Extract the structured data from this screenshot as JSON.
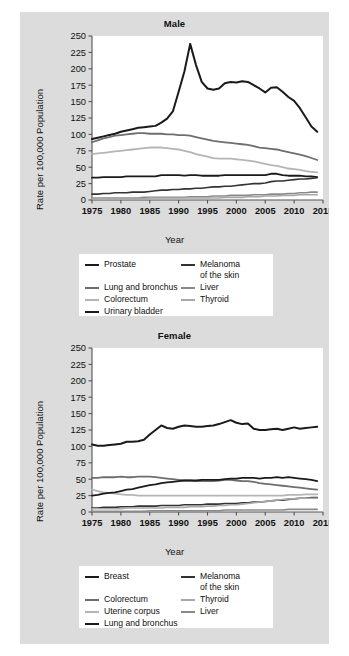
{
  "figure": {
    "background": "#dcdcdc",
    "panel_background": "#ffffff"
  },
  "chart_data": [
    {
      "type": "line",
      "title": "Male",
      "xlabel": "Year",
      "ylabel": "Rate per 100,000 Population",
      "xlim": [
        1975,
        2015
      ],
      "ylim": [
        0,
        250
      ],
      "xticks": [
        1975,
        1980,
        1985,
        1990,
        1995,
        2000,
        2005,
        2010,
        2015
      ],
      "yticks": [
        0,
        25,
        50,
        75,
        100,
        125,
        150,
        175,
        200,
        225,
        250
      ],
      "grid": false,
      "legend_position": "below",
      "x": [
        1975,
        1976,
        1977,
        1978,
        1979,
        1980,
        1981,
        1982,
        1983,
        1984,
        1985,
        1986,
        1987,
        1988,
        1989,
        1990,
        1991,
        1992,
        1993,
        1994,
        1995,
        1996,
        1997,
        1998,
        1999,
        2000,
        2001,
        2002,
        2003,
        2004,
        2005,
        2006,
        2007,
        2008,
        2009,
        2010,
        2011,
        2012,
        2013,
        2014
      ],
      "series": [
        {
          "name": "Prostate",
          "color": "#1a1a1a",
          "width": 2.0,
          "values": [
            93,
            95,
            97,
            99,
            101,
            104,
            106,
            108,
            110,
            111,
            112,
            113,
            118,
            124,
            135,
            165,
            196,
            238,
            206,
            180,
            170,
            168,
            170,
            178,
            180,
            179,
            181,
            180,
            175,
            170,
            164,
            171,
            172,
            165,
            157,
            151,
            140,
            126,
            112,
            104
          ]
        },
        {
          "name": "Lung and bronchus",
          "color": "#6e6e6e",
          "width": 1.8,
          "values": [
            88,
            91,
            94,
            96,
            98,
            99,
            100,
            101,
            102,
            102,
            101,
            101,
            101,
            100,
            100,
            99,
            99,
            98,
            96,
            94,
            92,
            90,
            89,
            88,
            87,
            86,
            85,
            84,
            82,
            80,
            79,
            78,
            77,
            75,
            73,
            71,
            69,
            67,
            64,
            61
          ]
        },
        {
          "name": "Colorectum",
          "color": "#b5b5b5",
          "width": 1.8,
          "values": [
            70,
            71,
            72,
            73,
            74,
            75,
            76,
            77,
            78,
            79,
            80,
            80,
            80,
            79,
            78,
            77,
            75,
            73,
            70,
            68,
            66,
            64,
            63,
            63,
            63,
            62,
            61,
            60,
            59,
            57,
            55,
            53,
            52,
            50,
            48,
            47,
            46,
            44,
            43,
            42
          ]
        },
        {
          "name": "Urinary bladder",
          "color": "#1a1a1a",
          "width": 1.8,
          "values": [
            34,
            34,
            35,
            35,
            35,
            35,
            36,
            36,
            36,
            36,
            36,
            36,
            38,
            38,
            38,
            38,
            37,
            38,
            38,
            37,
            37,
            37,
            37,
            38,
            38,
            38,
            38,
            38,
            38,
            38,
            38,
            40,
            40,
            38,
            37,
            37,
            37,
            36,
            36,
            35
          ]
        },
        {
          "name": "Melanoma of the skin",
          "color": "#333333",
          "width": 1.6,
          "values": [
            9,
            9,
            10,
            10,
            11,
            11,
            11,
            12,
            12,
            12,
            13,
            14,
            15,
            15,
            16,
            16,
            17,
            17,
            18,
            18,
            19,
            20,
            20,
            21,
            21,
            22,
            23,
            24,
            25,
            25,
            26,
            28,
            29,
            29,
            30,
            31,
            32,
            32,
            33,
            34
          ]
        },
        {
          "name": "Liver",
          "color": "#8a8a8a",
          "width": 1.6,
          "values": [
            3,
            3,
            3,
            3,
            3,
            3,
            3,
            3,
            3,
            4,
            4,
            4,
            4,
            4,
            4,
            4,
            4,
            5,
            5,
            5,
            5,
            6,
            6,
            6,
            7,
            7,
            7,
            7,
            8,
            8,
            8,
            9,
            9,
            9,
            10,
            10,
            11,
            11,
            12,
            12
          ]
        },
        {
          "name": "Thyroid",
          "color": "#a8a8a8",
          "width": 1.6,
          "values": [
            2,
            2,
            2,
            2,
            2,
            2,
            2,
            2,
            2,
            2,
            3,
            3,
            3,
            3,
            3,
            3,
            3,
            3,
            3,
            3,
            3,
            3,
            3,
            4,
            4,
            4,
            4,
            5,
            5,
            5,
            6,
            6,
            6,
            7,
            7,
            7,
            8,
            8,
            8,
            8
          ]
        }
      ],
      "legend": [
        {
          "label": "Prostate",
          "color": "#1a1a1a"
        },
        {
          "label": "Melanoma",
          "label2": "of the skin",
          "color": "#333333"
        },
        {
          "label": "Lung and bronchus",
          "color": "#6e6e6e"
        },
        {
          "label": "Colorectum",
          "color": "#b5b5b5"
        },
        {
          "label": "Liver",
          "color": "#8a8a8a"
        },
        {
          "label": "Urinary bladder",
          "color": "#1a1a1a"
        },
        {
          "label": "Thyroid",
          "color": "#a8a8a8"
        }
      ]
    },
    {
      "type": "line",
      "title": "Female",
      "xlabel": "Year",
      "ylabel": "Rate per 100,000 Population",
      "xlim": [
        1975,
        2015
      ],
      "ylim": [
        0,
        250
      ],
      "xticks": [
        1975,
        1980,
        1985,
        1990,
        1995,
        2000,
        2005,
        2010,
        2015
      ],
      "yticks": [
        0,
        25,
        50,
        75,
        100,
        125,
        150,
        175,
        200,
        225,
        250
      ],
      "grid": false,
      "legend_position": "below",
      "x": [
        1975,
        1976,
        1977,
        1978,
        1979,
        1980,
        1981,
        1982,
        1983,
        1984,
        1985,
        1986,
        1987,
        1988,
        1989,
        1990,
        1991,
        1992,
        1993,
        1994,
        1995,
        1996,
        1997,
        1998,
        1999,
        2000,
        2001,
        2002,
        2003,
        2004,
        2005,
        2006,
        2007,
        2008,
        2009,
        2010,
        2011,
        2012,
        2013,
        2014
      ],
      "series": [
        {
          "name": "Breast",
          "color": "#1a1a1a",
          "width": 2.0,
          "values": [
            103,
            101,
            101,
            102,
            103,
            104,
            107,
            107,
            108,
            110,
            118,
            125,
            132,
            128,
            127,
            130,
            132,
            131,
            130,
            130,
            131,
            132,
            134,
            137,
            140,
            136,
            134,
            135,
            127,
            125,
            125,
            126,
            127,
            125,
            127,
            129,
            127,
            128,
            129,
            130
          ]
        },
        {
          "name": "Colorectum",
          "color": "#6e6e6e",
          "width": 1.8,
          "values": [
            52,
            52,
            53,
            53,
            53,
            54,
            53,
            53,
            54,
            54,
            54,
            53,
            52,
            51,
            50,
            49,
            48,
            48,
            47,
            47,
            47,
            47,
            48,
            49,
            49,
            48,
            47,
            47,
            46,
            44,
            43,
            42,
            41,
            40,
            39,
            38,
            37,
            36,
            35,
            34
          ]
        },
        {
          "name": "Uterine corpus",
          "color": "#b5b5b5",
          "width": 1.8,
          "values": [
            34,
            32,
            30,
            29,
            28,
            27,
            26,
            26,
            25,
            25,
            25,
            25,
            25,
            25,
            25,
            25,
            25,
            25,
            25,
            25,
            25,
            25,
            25,
            25,
            25,
            25,
            25,
            25,
            25,
            25,
            25,
            25,
            25,
            25,
            26,
            26,
            26,
            27,
            27,
            27
          ]
        },
        {
          "name": "Lung and bronchus",
          "color": "#1a1a1a",
          "width": 1.8,
          "values": [
            25,
            26,
            28,
            29,
            30,
            32,
            34,
            35,
            37,
            39,
            41,
            42,
            44,
            45,
            46,
            47,
            48,
            48,
            48,
            49,
            49,
            49,
            49,
            50,
            51,
            51,
            52,
            52,
            52,
            51,
            52,
            52,
            53,
            52,
            53,
            52,
            51,
            50,
            49,
            47
          ]
        },
        {
          "name": "Melanoma of the skin",
          "color": "#333333",
          "width": 1.6,
          "values": [
            6,
            6,
            7,
            7,
            7,
            8,
            8,
            8,
            9,
            9,
            9,
            9,
            10,
            10,
            10,
            10,
            11,
            11,
            11,
            11,
            12,
            12,
            12,
            13,
            13,
            13,
            14,
            14,
            15,
            15,
            16,
            17,
            18,
            18,
            19,
            20,
            21,
            21,
            22,
            22
          ]
        },
        {
          "name": "Thyroid",
          "color": "#a8a8a8",
          "width": 1.6,
          "values": [
            5,
            5,
            5,
            5,
            5,
            5,
            6,
            6,
            6,
            6,
            6,
            6,
            6,
            7,
            7,
            7,
            7,
            8,
            8,
            8,
            9,
            9,
            10,
            10,
            11,
            11,
            12,
            13,
            14,
            15,
            16,
            17,
            18,
            19,
            20,
            20,
            21,
            21,
            21,
            21
          ]
        },
        {
          "name": "Liver",
          "color": "#8a8a8a",
          "width": 1.6,
          "values": [
            1,
            1,
            1,
            1,
            1,
            1,
            1,
            1,
            1,
            1,
            2,
            2,
            2,
            2,
            2,
            2,
            2,
            2,
            2,
            2,
            2,
            2,
            2,
            3,
            3,
            3,
            3,
            3,
            3,
            3,
            3,
            3,
            3,
            3,
            4,
            4,
            4,
            4,
            4,
            4
          ]
        }
      ],
      "legend": [
        {
          "label": "Breast",
          "color": "#1a1a1a"
        },
        {
          "label": "Melanoma",
          "label2": "of the skin",
          "color": "#333333"
        },
        {
          "label": "Colorectum",
          "color": "#6e6e6e"
        },
        {
          "label": "Uterine corpus",
          "color": "#b5b5b5"
        },
        {
          "label": "Thyroid",
          "color": "#a8a8a8"
        },
        {
          "label": "Lung and bronchus",
          "color": "#1a1a1a"
        },
        {
          "label": "Liver",
          "color": "#8a8a8a"
        }
      ]
    }
  ]
}
